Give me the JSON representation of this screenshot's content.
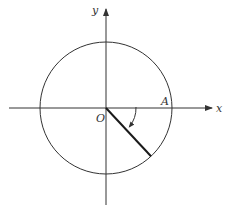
{
  "diagram": {
    "type": "unit-circle-angle",
    "labels": {
      "x_axis": "x",
      "y_axis": "y",
      "origin": "O",
      "point_a": "A"
    },
    "ray_angle_degrees": -47,
    "angle_direction": "clockwise",
    "colors": {
      "stroke": "#333333",
      "ray": "#1a1a1a",
      "background": "#ffffff"
    }
  }
}
